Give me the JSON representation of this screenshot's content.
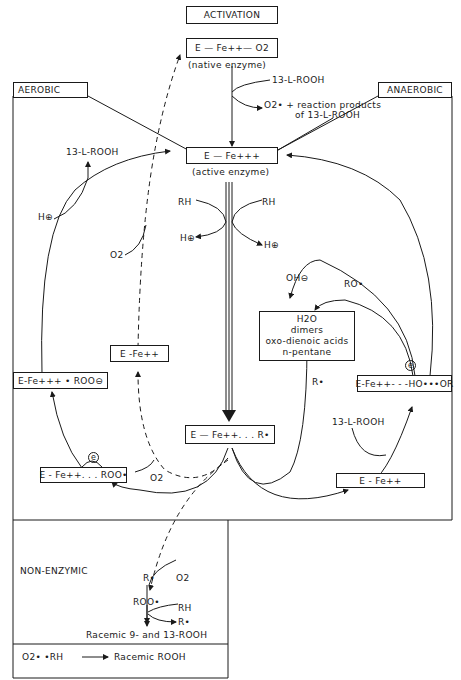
{
  "sections": {
    "activation": "ACTIVATION",
    "aerobic": "AEROBIC",
    "anaerobic": "ANAEROBIC",
    "non_enzymic": "NON-ENZYMIC"
  },
  "nodes": {
    "native_enzyme": "E — Fe++— O2",
    "native_enzyme_caption": "(native enzyme)",
    "active_enzyme": "E — Fe+++",
    "active_enzyme_caption": "(active enzyme)",
    "e_fe_radical": "E — Fe++. . . R•",
    "aerobic_e_fe2": "E -Fe++",
    "aerobic_e_fe3_roo": "E-Fe+++ • ROO⊖",
    "aerobic_e_fe2_roo": "E - Fe++. . . ROO•",
    "anaerobic_e_fe2_ho_or": "E-Fe++- - -HO•••OR",
    "anaerobic_e_fe2": "E - Fe++",
    "products": [
      "H2O",
      "dimers",
      "oxo-dienoic acids",
      "n-pentane"
    ]
  },
  "labels": {
    "activation_substrate": "13-L-ROOH",
    "activation_products_1": "O2• + reaction products",
    "activation_products_2": "of 13-L-ROOH",
    "rh_left": "RH",
    "rh_right": "RH",
    "h_plus_left": "H⊕",
    "h_plus_right": "H⊕",
    "aerobic_13_l_rooh": "13-L-ROOH",
    "aerobic_h_plus": "H⊕",
    "aerobic_o2_upper": "O2",
    "aerobic_o2_lower": "O2",
    "aerobic_electron": "e",
    "anaerobic_oh": "OH⊖",
    "anaerobic_ro": "RO•",
    "anaerobic_r": "R•",
    "anaerobic_electron": "e",
    "anaerobic_13_l_rooh": "13-L-ROOH",
    "nonenz_r": "R•",
    "nonenz_o2": "O2",
    "nonenz_roo": "ROO•",
    "nonenz_rh": "RH",
    "nonenz_r2": "R•",
    "nonenz_racemic": "Racemic  9- and 13-ROOH",
    "footer_reactant": "O2• •RH",
    "footer_product": "Racemic  ROOH"
  }
}
